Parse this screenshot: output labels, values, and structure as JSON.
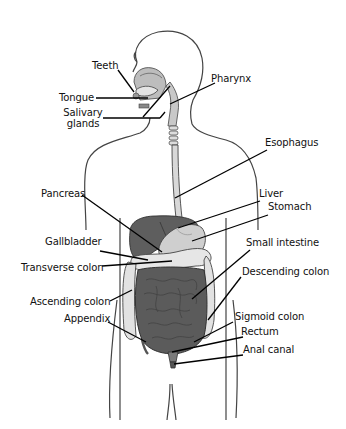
{
  "diagram": {
    "labels": {
      "teeth": "Teeth",
      "tongue": "Tongue",
      "salivary_glands_line1": "Salivary",
      "salivary_glands_line2": "glands",
      "pharynx": "Pharynx",
      "esophagus": "Esophagus",
      "pancreas": "Pancreas",
      "liver": "Liver",
      "stomach": "Stomach",
      "gallbladder": "Gallbladder",
      "small_intestine": "Small intestine",
      "transverse_colon": "Transverse colon",
      "descending_colon": "Descending colon",
      "ascending_colon": "Ascending colon",
      "appendix": "Appendix",
      "sigmoid_colon": "Sigmoid colon",
      "rectum": "Rectum",
      "anal_canal": "Anal canal"
    },
    "colors": {
      "outline": "#333333",
      "organ_dark": "#5a5a5a",
      "organ_mid": "#8a8a8a",
      "organ_light": "#d4d4d4",
      "colon": "#e4e4e4",
      "leader_line": "#000000"
    }
  }
}
